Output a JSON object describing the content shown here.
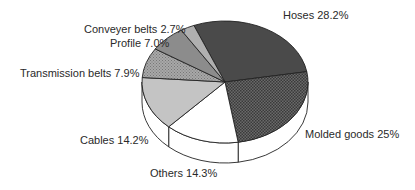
{
  "chart_data": {
    "type": "pie",
    "title": "",
    "style": "3d-tilted",
    "categories": [
      "Hoses",
      "Molded goods",
      "Others",
      "Cables",
      "Transmission belts",
      "Profile",
      "Conveyer belts"
    ],
    "values": [
      28.2,
      25,
      14.3,
      14.2,
      7.9,
      7.0,
      2.7
    ],
    "unit": "%",
    "labels": [
      "Hoses 28.2%",
      "Molded goods 25%",
      "Others 14.3%",
      "Cables 14.2%",
      "Transmission belts 7.9%",
      "Profile 7.0%",
      "Conveyer belts 2.7%"
    ],
    "fills": [
      "#4a4a4a",
      "pattern-dots-dark",
      "#ffffff",
      "#c4c4c4",
      "pattern-hatch-gray",
      "#8c8c8c",
      "#b0b0b0"
    ],
    "legend": "none (direct labels)"
  },
  "labels": {
    "hoses": "Hoses 28.2%",
    "molded": "Molded goods 25%",
    "others": "Others 14.3%",
    "cables": "Cables 14.2%",
    "transmission": "Transmission belts 7.9%",
    "profile": "Profile 7.0%",
    "conveyer": "Conveyer belts 2.7%"
  }
}
